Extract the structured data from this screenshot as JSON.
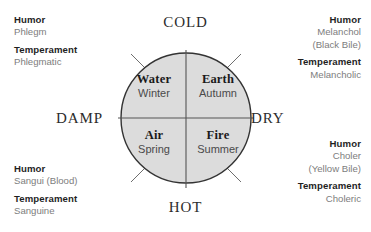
{
  "diagram": {
    "colors": {
      "circle_fill": "#dcdcdc",
      "circle_stroke": "#333333",
      "divider_stroke": "#555555",
      "leader_stroke": "#6e6e6e",
      "heading_text": "#1f1f1f",
      "value_text": "#7d7d7d",
      "axis_text": "#2c2c2c",
      "element_text": "#1a1a1a",
      "season_text": "#4a4a4a",
      "background": "#ffffff"
    },
    "axes": {
      "top": "COLD",
      "bottom": "HOT",
      "left": "DAMP",
      "right": "DRY"
    },
    "quadrants": [
      {
        "id": "water",
        "element": "Water",
        "season": "Winter"
      },
      {
        "id": "earth",
        "element": "Earth",
        "season": "Autumn"
      },
      {
        "id": "air",
        "element": "Air",
        "season": "Spring"
      },
      {
        "id": "fire",
        "element": "Fire",
        "season": "Summer"
      }
    ],
    "annotations": [
      {
        "id": "phlegm",
        "humor_label": "Humor",
        "humor_value": "Phlegm",
        "humor_value_extra": "",
        "temperament_label": "Temperament",
        "temperament_value": "Phlegmatic"
      },
      {
        "id": "melanchol",
        "humor_label": "Humor",
        "humor_value": "Melanchol",
        "humor_value_extra": "(Black Bile)",
        "temperament_label": "Temperament",
        "temperament_value": "Melancholic"
      },
      {
        "id": "sangui",
        "humor_label": "Humor",
        "humor_value": "Sangui (Blood)",
        "humor_value_extra": "",
        "temperament_label": "Temperament",
        "temperament_value": "Sanguine"
      },
      {
        "id": "choler",
        "humor_label": "Humor",
        "humor_value": "Choler",
        "humor_value_extra": "(Yellow Bile)",
        "temperament_label": "Temperament",
        "temperament_value": "Choleric"
      }
    ]
  }
}
